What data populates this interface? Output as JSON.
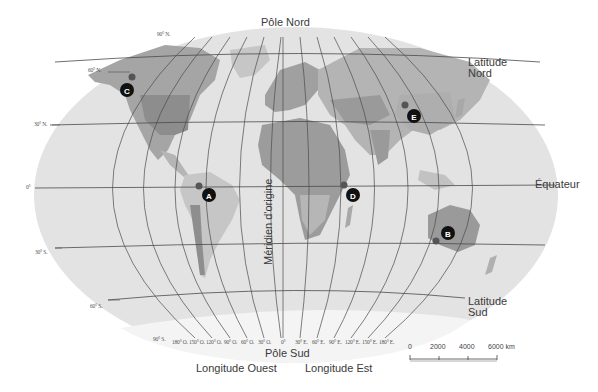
{
  "map": {
    "title_north_pole": "Pôle Nord",
    "title_south_pole": "Pôle Sud",
    "equator_label": "Équateur",
    "prime_meridian_label": "Méridien d'origine",
    "latitude_north_label": [
      "Latitude",
      "Nord"
    ],
    "latitude_south_label": [
      "Latitude",
      "Sud"
    ],
    "longitude_west_label": "Longitude Ouest",
    "longitude_east_label": "Longitude Est",
    "latitude_ticks": [
      "90° N.",
      "60° N.",
      "30° N.",
      "0°",
      "30° S.",
      "60° S.",
      "90° S."
    ],
    "longitude_ticks_west": [
      "180° O.",
      "150° O.",
      "120° O.",
      "90° O.",
      "60° O.",
      "30° O."
    ],
    "longitude_ticks_center": "0°",
    "longitude_ticks_east": [
      "30° E.",
      "60° E.",
      "90° E.",
      "120° E.",
      "150° E.",
      "180° E."
    ],
    "markers": [
      {
        "id": "A",
        "region": "Amérique du Sud (nord du Brésil)"
      },
      {
        "id": "B",
        "region": "Australie"
      },
      {
        "id": "C",
        "region": "Alaska"
      },
      {
        "id": "D",
        "region": "Afrique de l'Est"
      },
      {
        "id": "E",
        "region": "Asie centrale / Chine"
      }
    ],
    "scale_bar": {
      "ticks": [
        "0",
        "2000",
        "4000",
        "6000 km"
      ]
    },
    "colors": {
      "ocean": "#e3e3e3",
      "land_light": "#c8c8c8",
      "land_mid": "#a8a8a8",
      "land_dark": "#8e8e8e",
      "grid": "#4a4a4a",
      "marker": "#111111"
    }
  }
}
